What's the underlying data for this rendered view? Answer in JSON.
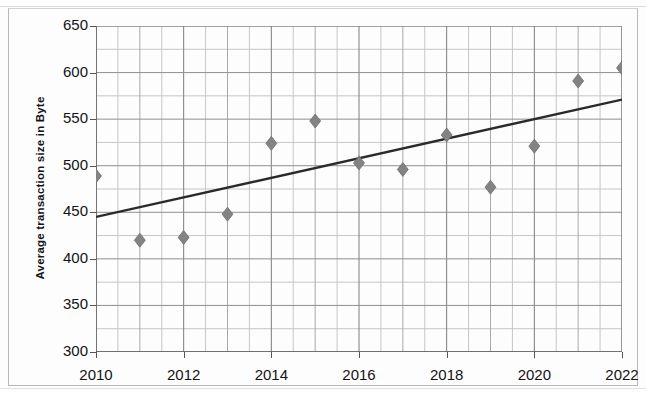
{
  "chart_data": {
    "type": "scatter",
    "title": "",
    "xlabel": "",
    "ylabel": "Average transaction size in Byte",
    "xlim": [
      2010,
      2022
    ],
    "ylim": [
      300,
      650
    ],
    "ytick_step": 50,
    "yticks": [
      300,
      350,
      400,
      450,
      500,
      550,
      600,
      650
    ],
    "xticks": [
      2010,
      2012,
      2014,
      2016,
      2018,
      2020,
      2022
    ],
    "xtick_labels": [
      "2010",
      "2012",
      "2014",
      "2016",
      "2018",
      "2020",
      "2022"
    ],
    "ytick_labels": [
      "300",
      "350",
      "400",
      "450",
      "500",
      "550",
      "600",
      "650"
    ],
    "grid": true,
    "minor_grid": true,
    "legend": "none",
    "marker": "diamond",
    "marker_color": "#838383",
    "trendline_color": "#2a2a2a",
    "x": [
      2010,
      2011,
      2012,
      2013,
      2014,
      2015,
      2016,
      2017,
      2018,
      2019,
      2020,
      2021,
      2022
    ],
    "values": [
      489,
      420,
      423,
      448,
      524,
      548,
      503,
      496,
      533,
      477,
      521,
      591,
      605
    ],
    "series": [
      {
        "name": "Average transaction size",
        "values": [
          489,
          420,
          423,
          448,
          524,
          548,
          503,
          496,
          533,
          477,
          521,
          591,
          605
        ]
      },
      {
        "name": "Linear trendline",
        "type": "line",
        "x": [
          2010,
          2022
        ],
        "values": [
          445,
          571
        ]
      }
    ]
  }
}
